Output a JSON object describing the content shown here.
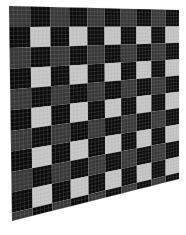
{
  "image": {
    "description": "Perspective-warped plaid checkerboard calibration pattern",
    "width": 186,
    "height": 235,
    "background": "#ffffff"
  },
  "board": {
    "corners": {
      "top_left": [
        9,
        6
      ],
      "top_right": [
        179,
        10
      ],
      "bottom_right": [
        179,
        179
      ],
      "bottom_left": [
        12,
        221
      ]
    },
    "columns": 10,
    "rows": 10.4,
    "light_square_count_per_row": 5,
    "light_square_rows": 5,
    "colors": {
      "light_square": "#c9c9c9",
      "dark_gray_band": "#383838",
      "black": "#0b0b0b",
      "grid_line": "#9a9a9a"
    },
    "fine_grid_subdivisions_per_unit": 5,
    "grid_line_opacity": 0.35
  }
}
